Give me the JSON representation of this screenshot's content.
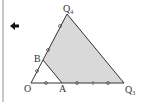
{
  "diagram": {
    "labels": {
      "top": "Q",
      "top_sub": "4",
      "right": "Q",
      "right_sub": "3",
      "origin": "O",
      "a": "A",
      "b": "B"
    },
    "colors": {
      "shade": "#d9d9d9",
      "stroke": "#333333",
      "arrow": "#111111"
    },
    "arrow": "back-arrow"
  }
}
